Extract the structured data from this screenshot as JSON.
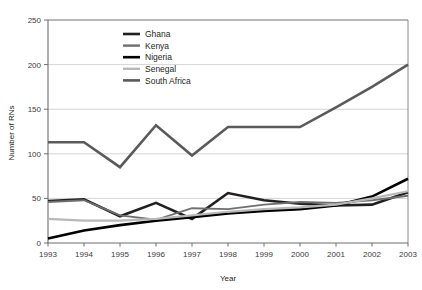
{
  "chart_data": {
    "type": "line",
    "title": "",
    "xlabel": "Year",
    "ylabel": "Number of RNs",
    "categories": [
      "1993",
      "1994",
      "1995",
      "1996",
      "1997",
      "1998",
      "1999",
      "2000",
      "2001",
      "2002",
      "2003"
    ],
    "x": [
      1993,
      1994,
      1995,
      1996,
      1997,
      1998,
      1999,
      2000,
      2001,
      2002,
      2003
    ],
    "xlim": [
      1993,
      2003
    ],
    "ylim": [
      0,
      250
    ],
    "yticks": [
      0,
      50,
      100,
      150,
      200,
      250
    ],
    "xticks": [
      "1993",
      "1994",
      "1995",
      "1996",
      "1997",
      "1998",
      "1999",
      "2000",
      "2001",
      "2002",
      "2003"
    ],
    "grid": "horizontal",
    "legend_position": "top-center-inside",
    "series": [
      {
        "name": "Ghana",
        "color": "#231f20",
        "width": 2.6,
        "values": [
          47,
          49,
          30,
          45,
          27,
          56,
          48,
          44,
          42,
          43,
          57
        ]
      },
      {
        "name": "Kenya",
        "color": "#6f6f6f",
        "width": 1.9,
        "values": [
          46,
          48,
          31,
          26,
          39,
          38,
          43,
          46,
          45,
          48,
          53
        ]
      },
      {
        "name": "Nigeria",
        "color": "#000000",
        "width": 2.6,
        "values": [
          5,
          14,
          20,
          25,
          29,
          33,
          36,
          38,
          42,
          52,
          72
        ]
      },
      {
        "name": "Senegal",
        "color": "#b8b8b8",
        "width": 2.2,
        "values": [
          27,
          25,
          25,
          27,
          31,
          35,
          38,
          40,
          43,
          50,
          58
        ]
      },
      {
        "name": "South Africa",
        "color": "#5a5a5a",
        "width": 2.6,
        "values": [
          113,
          113,
          85,
          132,
          98,
          130,
          130,
          130,
          152,
          175,
          200
        ]
      }
    ],
    "legend": [
      "Ghana",
      "Kenya",
      "Nigeria",
      "Senegal",
      "South Africa"
    ]
  },
  "axes": {
    "y_title": "Number of RNs",
    "x_title": "Year"
  }
}
